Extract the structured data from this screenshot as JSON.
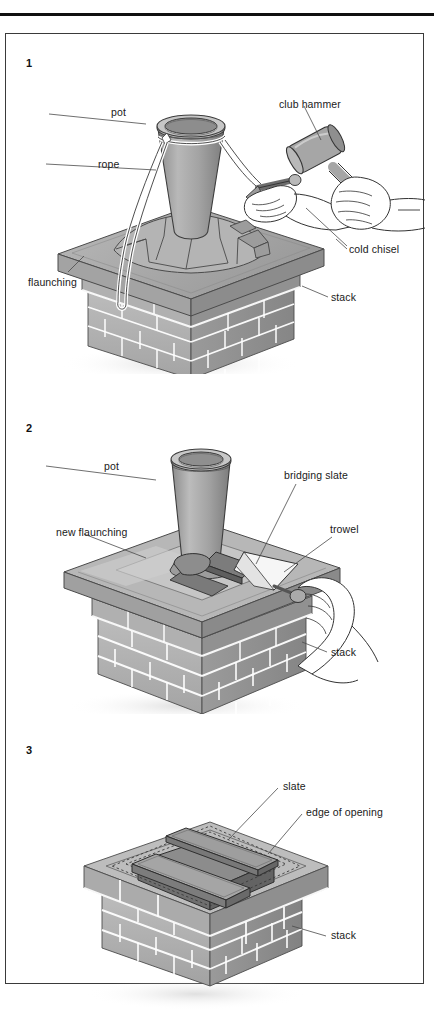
{
  "figure": {
    "domain_title": "Repairing a chimney pot and flaunching",
    "panel_count": 3,
    "frame_border_color": "#3a3a3a",
    "rule_color": "#101010"
  },
  "palette": {
    "brick_light": "#c9c9c9",
    "brick_mid": "#a8a8a8",
    "brick_dark": "#8d8d8d",
    "mortar": "#ffffff",
    "pot_light": "#c2c2c2",
    "pot_mid": "#a0a0a0",
    "pot_dark": "#7f7f7f",
    "flaunch_light": "#bdbdbd",
    "flaunch_dark": "#909090",
    "slate_dark": "#6f6f6f",
    "outline": "#303030",
    "leader": "#4a4a4a",
    "text": "#1a1a1a"
  },
  "panels": [
    {
      "number": "1",
      "labels": [
        {
          "id": "pot",
          "text": "pot"
        },
        {
          "id": "rope",
          "text": "rope"
        },
        {
          "id": "flaunching",
          "text": "flaunching"
        },
        {
          "id": "club_hammer",
          "text": "club hammer"
        },
        {
          "id": "cold_chisel",
          "text": "cold chisel"
        },
        {
          "id": "stack",
          "text": "stack"
        }
      ]
    },
    {
      "number": "2",
      "labels": [
        {
          "id": "pot",
          "text": "pot"
        },
        {
          "id": "new_flaunching",
          "text": "new flaunching"
        },
        {
          "id": "bridging_slate",
          "text": "bridging slate"
        },
        {
          "id": "trowel",
          "text": "trowel"
        },
        {
          "id": "stack",
          "text": "stack"
        }
      ]
    },
    {
      "number": "3",
      "labels": [
        {
          "id": "slate",
          "text": "slate"
        },
        {
          "id": "edge_of_opening",
          "text": "edge of opening"
        },
        {
          "id": "stack",
          "text": "stack"
        }
      ]
    }
  ]
}
